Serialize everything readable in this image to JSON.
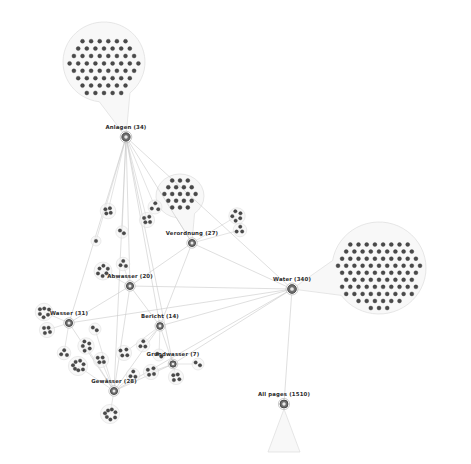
{
  "view": {
    "background_color": "#ffffff",
    "edge_color": "#c9c9c9",
    "hull_fill": "#f2f2f2",
    "hull_stroke": "#dcdcdc",
    "node_color": "#4a4a4a",
    "hub_color": "#6e6e6e",
    "label_color": "#2b2b2b",
    "width": 471,
    "height": 464
  },
  "graph": {
    "type": "node-link-cluster",
    "hubs": [
      {
        "id": "anlagen",
        "label": "Anlagen (34)",
        "count": 34,
        "x": 126,
        "y": 137,
        "r": 4.2,
        "label_x": 126,
        "label_y": 131
      },
      {
        "id": "verordnung",
        "label": "Verordnung (27)",
        "count": 27,
        "x": 192,
        "y": 243,
        "r": 3.6,
        "label_x": 192,
        "label_y": 237
      },
      {
        "id": "water",
        "label": "Water (340)",
        "count": 340,
        "x": 292,
        "y": 289,
        "r": 4.4,
        "label_x": 292,
        "label_y": 283
      },
      {
        "id": "abwasser",
        "label": "Abwasser (20)",
        "count": 20,
        "x": 130,
        "y": 286,
        "r": 3.6,
        "label_x": 130,
        "label_y": 280
      },
      {
        "id": "wasser",
        "label": "Wasser (31)",
        "count": 31,
        "x": 69,
        "y": 323,
        "r": 3.6,
        "label_x": 69,
        "label_y": 317
      },
      {
        "id": "bericht",
        "label": "Bericht (14)",
        "count": 14,
        "x": 160,
        "y": 326,
        "r": 3.4,
        "label_x": 160,
        "label_y": 320
      },
      {
        "id": "grundwasser",
        "label": "Grundwasser (7)",
        "count": 7,
        "x": 173,
        "y": 364,
        "r": 3.2,
        "label_x": 173,
        "label_y": 358
      },
      {
        "id": "gewaesser",
        "label": "Gewässer (28)",
        "count": 28,
        "x": 114,
        "y": 391,
        "r": 3.6,
        "label_x": 114,
        "label_y": 385
      },
      {
        "id": "allpages",
        "label": "All pages (1510)",
        "count": 1510,
        "x": 284,
        "y": 404,
        "r": 4.0,
        "label_x": 284,
        "label_y": 398
      }
    ],
    "balloons": [
      {
        "id": "balloon-anlagen-top",
        "parent": "anlagen",
        "cx": 104,
        "cy": 62,
        "rx": 41,
        "ry": 40,
        "nodes": 62,
        "cols": 9,
        "spacing": 8.6,
        "stem_to_x": 126,
        "stem_to_y": 137
      },
      {
        "id": "balloon-water-right",
        "parent": "water",
        "cx": 379,
        "cy": 268,
        "rx": 47,
        "ry": 46,
        "nodes": 95,
        "cols": 11,
        "spacing": 8.2,
        "stem_to_x": 292,
        "stem_to_y": 289
      },
      {
        "id": "balloon-verordnung",
        "parent": "verordnung",
        "cx": 180,
        "cy": 196,
        "rx": 24,
        "ry": 22,
        "nodes": 27,
        "cols": 6,
        "spacing": 7.8,
        "stem_to_x": 192,
        "stem_to_y": 243
      }
    ],
    "fans": [
      {
        "id": "fan-allpages",
        "parent": "allpages",
        "apex_x": 284,
        "apex_y": 409,
        "left_x": 268,
        "left_y": 452,
        "right_x": 300,
        "right_y": 452
      }
    ],
    "mini_clusters": [
      {
        "id": "mc-1",
        "cx": 108,
        "cy": 211,
        "n": 4,
        "r": 5.2,
        "parent": "anlagen"
      },
      {
        "id": "mc-2",
        "cx": 147,
        "cy": 220,
        "n": 4,
        "r": 5.0,
        "parent": "anlagen"
      },
      {
        "id": "mc-3",
        "cx": 122,
        "cy": 232,
        "n": 2,
        "r": 3.6,
        "parent": "anlagen"
      },
      {
        "id": "mc-4",
        "cx": 155,
        "cy": 207,
        "n": 3,
        "r": 4.4,
        "parent": "anlagen"
      },
      {
        "id": "mc-5",
        "cx": 96,
        "cy": 241,
        "n": 1,
        "r": 2.4,
        "parent": "anlagen"
      },
      {
        "id": "mc-6",
        "cx": 237,
        "cy": 216,
        "n": 5,
        "r": 5.6,
        "parent": "verordnung"
      },
      {
        "id": "mc-7",
        "cx": 240,
        "cy": 230,
        "n": 3,
        "r": 4.2,
        "parent": "verordnung"
      },
      {
        "id": "mc-8",
        "cx": 103,
        "cy": 271,
        "n": 6,
        "r": 6.4,
        "parent": "abwasser"
      },
      {
        "id": "mc-9",
        "cx": 123,
        "cy": 264,
        "n": 3,
        "r": 4.2,
        "parent": "abwasser"
      },
      {
        "id": "mc-10",
        "cx": 44,
        "cy": 312,
        "n": 6,
        "r": 6.2,
        "parent": "wasser"
      },
      {
        "id": "mc-11",
        "cx": 47,
        "cy": 330,
        "n": 4,
        "r": 5.0,
        "parent": "wasser"
      },
      {
        "id": "mc-12",
        "cx": 86,
        "cy": 346,
        "n": 5,
        "r": 5.6,
        "parent": "gewaesser"
      },
      {
        "id": "mc-13",
        "cx": 78,
        "cy": 366,
        "n": 7,
        "r": 7.0,
        "parent": "gewaesser"
      },
      {
        "id": "mc-14",
        "cx": 101,
        "cy": 360,
        "n": 4,
        "r": 5.0,
        "parent": "gewaesser"
      },
      {
        "id": "mc-15",
        "cx": 124,
        "cy": 353,
        "n": 4,
        "r": 5.0,
        "parent": "bericht"
      },
      {
        "id": "mc-16",
        "cx": 143,
        "cy": 345,
        "n": 3,
        "r": 4.2,
        "parent": "bericht"
      },
      {
        "id": "mc-17",
        "cx": 151,
        "cy": 372,
        "n": 4,
        "r": 5.0,
        "parent": "grundwasser"
      },
      {
        "id": "mc-18",
        "cx": 176,
        "cy": 377,
        "n": 4,
        "r": 5.0,
        "parent": "grundwasser"
      },
      {
        "id": "mc-19",
        "cx": 110,
        "cy": 414,
        "n": 7,
        "r": 7.0,
        "parent": "gewaesser"
      },
      {
        "id": "mc-20",
        "cx": 133,
        "cy": 375,
        "n": 3,
        "r": 4.2,
        "parent": "gewaesser"
      },
      {
        "id": "mc-21",
        "cx": 159,
        "cy": 355,
        "n": 2,
        "r": 3.4,
        "parent": "bericht"
      },
      {
        "id": "mc-22",
        "cx": 198,
        "cy": 364,
        "n": 2,
        "r": 3.4,
        "parent": "grundwasser"
      },
      {
        "id": "mc-23",
        "cx": 64,
        "cy": 353,
        "n": 3,
        "r": 4.2,
        "parent": "wasser"
      },
      {
        "id": "mc-24",
        "cx": 95,
        "cy": 329,
        "n": 2,
        "r": 3.4,
        "parent": "gewaesser"
      }
    ],
    "edges": [
      {
        "from": "anlagen",
        "to": "water"
      },
      {
        "from": "anlagen",
        "to": "verordnung"
      },
      {
        "from": "anlagen",
        "to": "abwasser"
      },
      {
        "from": "anlagen",
        "to": "bericht"
      },
      {
        "from": "anlagen",
        "to": "gewaesser"
      },
      {
        "from": "anlagen",
        "to": "grundwasser"
      },
      {
        "from": "anlagen",
        "to": "wasser"
      },
      {
        "from": "verordnung",
        "to": "water"
      },
      {
        "from": "abwasser",
        "to": "water"
      },
      {
        "from": "wasser",
        "to": "water"
      },
      {
        "from": "bericht",
        "to": "water"
      },
      {
        "from": "grundwasser",
        "to": "water"
      },
      {
        "from": "gewaesser",
        "to": "water"
      },
      {
        "from": "water",
        "to": "allpages"
      },
      {
        "from": "abwasser",
        "to": "bericht"
      },
      {
        "from": "abwasser",
        "to": "wasser"
      },
      {
        "from": "abwasser",
        "to": "gewaesser"
      },
      {
        "from": "wasser",
        "to": "gewaesser"
      },
      {
        "from": "bericht",
        "to": "gewaesser"
      },
      {
        "from": "bericht",
        "to": "grundwasser"
      },
      {
        "from": "gewaesser",
        "to": "grundwasser"
      },
      {
        "from": "verordnung",
        "to": "bericht"
      },
      {
        "from": "verordnung",
        "to": "abwasser"
      }
    ]
  }
}
